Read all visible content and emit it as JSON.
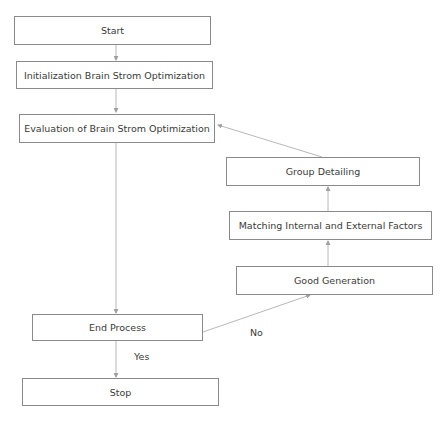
{
  "diagram": {
    "type": "flowchart",
    "nodes": {
      "start": "Start",
      "init": "Initialization Brain Strom Optimization",
      "eval": "Evaluation of Brain Strom Optimization",
      "group": "Group Detailing",
      "matching": "Matching Internal and External Factors",
      "good": "Good Generation",
      "end": "End Process",
      "stop": "Stop"
    },
    "edge_labels": {
      "yes": "Yes",
      "no": "No"
    },
    "edges": [
      {
        "from": "start",
        "to": "init"
      },
      {
        "from": "init",
        "to": "eval"
      },
      {
        "from": "eval",
        "to": "end"
      },
      {
        "from": "end",
        "to": "stop",
        "label": "Yes"
      },
      {
        "from": "end",
        "to": "good",
        "label": "No"
      },
      {
        "from": "good",
        "to": "matching"
      },
      {
        "from": "matching",
        "to": "group"
      },
      {
        "from": "group",
        "to": "eval"
      }
    ],
    "colors": {
      "border": "#8a8a8a",
      "edge": "#b0b0b0",
      "text": "#3a3a3a"
    }
  }
}
